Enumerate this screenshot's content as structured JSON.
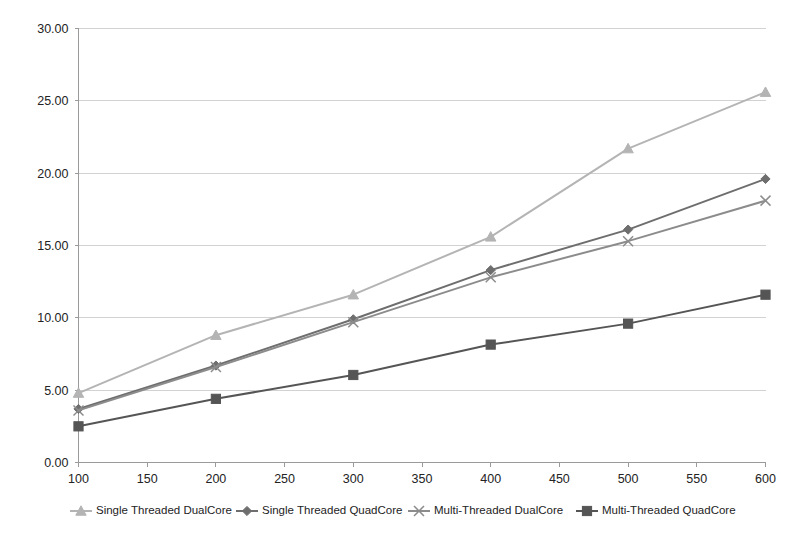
{
  "chart_data": {
    "type": "line",
    "title": "",
    "subtitle": "",
    "xlabel": "",
    "ylabel": "",
    "xlim": [
      100,
      600
    ],
    "ylim": [
      0,
      30
    ],
    "grid": "horizontal",
    "legend_position": "bottom",
    "x": [
      100,
      200,
      300,
      400,
      500,
      600
    ],
    "categories": [
      "100",
      "200",
      "300",
      "400",
      "500",
      "600"
    ],
    "xticks": [
      100,
      150,
      200,
      250,
      300,
      350,
      400,
      450,
      500,
      550,
      600
    ],
    "xtick_labels": [
      "100",
      "150",
      "200",
      "250",
      "300",
      "350",
      "400",
      "450",
      "500",
      "550",
      "600"
    ],
    "yticks": [
      0,
      5,
      10,
      15,
      20,
      25,
      30
    ],
    "ytick_labels": [
      "0.00",
      "5.00",
      "10.00",
      "15.00",
      "20.00",
      "25.00",
      "30.00"
    ],
    "series": [
      {
        "name": "Single Threaded DualCore",
        "marker": "triangle",
        "color": "#b4b4b4",
        "values": [
          4.8,
          8.8,
          11.6,
          15.6,
          21.7,
          25.6
        ]
      },
      {
        "name": "Single Threaded QuadCore",
        "marker": "diamond",
        "color": "#6e6e6e",
        "values": [
          3.7,
          6.7,
          9.9,
          13.3,
          16.1,
          19.6
        ]
      },
      {
        "name": "Multi-Threaded DualCore",
        "marker": "cross",
        "color": "#8c8c8c",
        "values": [
          3.6,
          6.6,
          9.7,
          12.8,
          15.3,
          18.1
        ]
      },
      {
        "name": "Multi-Threaded QuadCore",
        "marker": "square",
        "color": "#555555",
        "values": [
          2.5,
          4.4,
          6.05,
          8.15,
          9.6,
          11.6
        ]
      }
    ]
  },
  "legend": {
    "items": [
      {
        "label": "Single Threaded DualCore"
      },
      {
        "label": "Single Threaded QuadCore"
      },
      {
        "label": "Multi-Threaded DualCore"
      },
      {
        "label": "Multi-Threaded QuadCore"
      }
    ]
  },
  "style": {
    "background": "#ffffff",
    "grid_color": "#d2d2d2",
    "axis_color": "#9a9a9a",
    "text_color": "#232323"
  }
}
